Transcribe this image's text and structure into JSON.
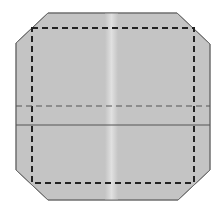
{
  "diagram": {
    "type": "fold-diagram",
    "colors": {
      "background": "#ffffff",
      "paper_fill": "#c4c4c4",
      "paper_edge": "#6e6e6e",
      "center_band": "#dcdcdc",
      "valley_fold": "#222222",
      "mountain_fold": "#555555",
      "crease": "#555555"
    },
    "shape": {
      "name": "octagonal-paper",
      "points": [
        [
          48,
          13
        ],
        [
          177,
          13
        ],
        [
          210,
          44
        ],
        [
          210,
          170
        ],
        [
          178,
          200
        ],
        [
          48,
          200
        ],
        [
          16,
          170
        ],
        [
          16,
          43
        ]
      ]
    },
    "dashed_square": {
      "x": 32,
      "y": 28,
      "width": 162,
      "height": 155
    },
    "dashed_line": {
      "y": 106,
      "x1": 16,
      "x2": 210
    },
    "solid_line": {
      "y": 125,
      "x1": 16,
      "x2": 210
    },
    "center_band": {
      "x": 107,
      "width": 9
    }
  }
}
